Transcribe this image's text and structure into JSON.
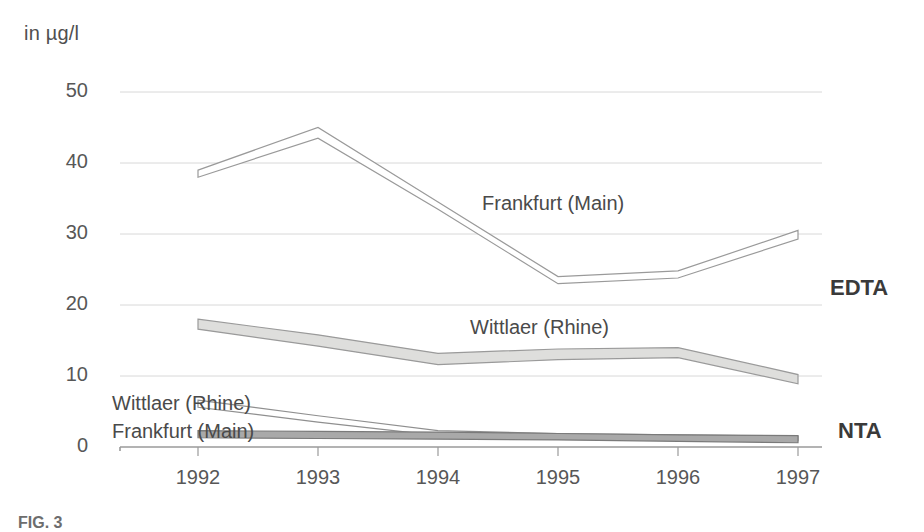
{
  "figure": {
    "unit_label": "in µg/l",
    "caption": "FIG. 3",
    "corner_mark": "",
    "axis_color": "#9a9a9a",
    "grid_color": "#d8d8d8",
    "text_color": "#4a4a4a"
  },
  "groups": {
    "edta_label": "EDTA",
    "nta_label": "NTA"
  },
  "labels": {
    "edta_frankfurt": "Frankfurt (Main)",
    "edta_wittlaer": "Wittlaer (Rhine)",
    "nta_wittlaer": "Wittlaer (Rhine)",
    "nta_frankfurt": "Frankfurt (Main)"
  },
  "chart_data": {
    "type": "line",
    "title": "",
    "subtitle": "",
    "xlabel": "",
    "ylabel": "in µg/l",
    "categories": [
      "1992",
      "1993",
      "1994",
      "1995",
      "1996",
      "1997"
    ],
    "x": [
      1992,
      1993,
      1994,
      1995,
      1996,
      1997
    ],
    "ylim": [
      0,
      50
    ],
    "yticks": [
      0,
      10,
      20,
      30,
      40,
      50
    ],
    "grid": true,
    "legend": "in-plot annotations",
    "series": [
      {
        "name": "EDTA — Frankfurt (Main)",
        "group": "EDTA",
        "style": "band",
        "fill": "#ffffff",
        "stroke": "#9a9a9a",
        "upper": [
          39.0,
          45.0,
          34.5,
          24.0,
          24.8,
          30.5
        ],
        "lower": [
          38.0,
          43.5,
          33.5,
          23.0,
          23.8,
          29.3
        ],
        "values": [
          38.5,
          44.2,
          34.0,
          23.5,
          24.3,
          29.9
        ]
      },
      {
        "name": "EDTA — Wittlaer (Rhine)",
        "group": "EDTA",
        "style": "band",
        "fill": "#dededc",
        "stroke": "#9a9a9a",
        "upper": [
          18.0,
          15.8,
          13.2,
          13.8,
          14.0,
          10.2
        ],
        "lower": [
          16.6,
          14.2,
          11.6,
          12.3,
          12.6,
          8.9
        ],
        "values": [
          17.3,
          15.0,
          12.4,
          13.0,
          13.3,
          9.6
        ]
      },
      {
        "name": "NTA — Wittlaer (Rhine)",
        "group": "NTA",
        "style": "band",
        "fill": "#ffffff",
        "stroke": "#8f8f8f",
        "upper": [
          6.6,
          4.4,
          2.3,
          1.9,
          1.7,
          1.5
        ],
        "lower": [
          5.6,
          3.5,
          1.6,
          1.3,
          1.1,
          0.9
        ],
        "values": [
          6.1,
          3.9,
          1.9,
          1.6,
          1.4,
          1.2
        ]
      },
      {
        "name": "NTA — Frankfurt (Main)",
        "group": "NTA",
        "style": "band",
        "fill": "#a9a9a9",
        "stroke": "#7a7a7a",
        "upper": [
          2.3,
          2.2,
          2.1,
          1.9,
          1.7,
          1.6
        ],
        "lower": [
          1.3,
          1.2,
          1.1,
          1.0,
          0.8,
          0.6
        ],
        "values": [
          1.8,
          1.7,
          1.6,
          1.45,
          1.25,
          1.1
        ]
      }
    ]
  },
  "geometry": {
    "plot_left": 120,
    "plot_right": 800,
    "y_zero_px": 447,
    "y_top_px": 92,
    "x_positions": [
      198,
      318,
      438,
      558,
      678,
      798
    ]
  }
}
